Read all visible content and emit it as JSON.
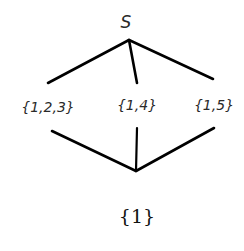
{
  "diagram": {
    "type": "lattice",
    "nodes": {
      "top": {
        "label": "S",
        "x": 126,
        "y": 24
      },
      "a": {
        "label": "{1,2,3}",
        "x": 48,
        "y": 107
      },
      "b": {
        "label": "{1,4}",
        "x": 137,
        "y": 104
      },
      "c": {
        "label": "{1,5}",
        "x": 215,
        "y": 104
      },
      "bottom": {
        "label": "{1}",
        "x": 137,
        "y": 217
      }
    },
    "edges": [
      {
        "from": "top",
        "to": "a"
      },
      {
        "from": "top",
        "to": "b"
      },
      {
        "from": "top",
        "to": "c"
      },
      {
        "from": "a",
        "to": "bottom"
      },
      {
        "from": "b",
        "to": "bottom"
      },
      {
        "from": "c",
        "to": "bottom"
      }
    ],
    "line_color": "#000000"
  }
}
